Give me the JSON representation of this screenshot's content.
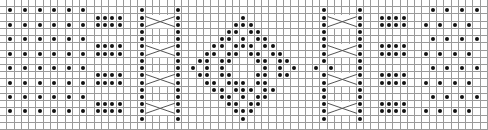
{
  "chart": {
    "columns": 67,
    "rows": 18,
    "legend": {
      "o": "dot (purl stitch)",
      ".": "empty cell (knit stitch)"
    },
    "grid_rows": [
      "...................................................................",
      ".o.o.o.o.o.o.......o....o...................o....o.........o.o.o.o.",
      ".............oooo..o....o........o..........o....o..oooo..........",
      ".o.o.o.o.o.o.oooo..o....o.......ooo.........o....o..oooo..o.o.o.o.",
      "...................o....o......oo.oo........o....o.................",
      ".o.o.o.o.o.o.......o....o.....oo.o.oo.......o....o.........o.o.o.o.",
      ".............oooo..o....o....oo.ooo.oo......o....o..oooo..........",
      ".o.o.o.o.o.o.oooo..o....o...oo.oo.oo.oo.....o....o..oooo..o.o.o.o.",
      "...................o....o..oo.oo...oo.oo....o....o.................",
      ".o.o.o.o.o.o.......o....o.o.o.o.....o.o.o..o.o...o.........o.o.o.o.",
      ".............oooo..o....o..oo.oo...oo.oo....o....o..oooo..........",
      ".o.o.o.o.o.o.oooo..o....o...oo.ooo.oo.......o....o..oooo..o.o.o.o.",
      "...................o....o....oo.ooo.oo......o....o.................",
      ".o.o.o.o.o.o.......o....o.....oo.o.oo.......o....o.........o.o.o.o.",
      ".............oooo..o....o......oo.oo........o....o..oooo..........",
      ".o.o.o.o.o.o.oooo..o....o.......ooo.........o....o..oooo..o.o.o.o.",
      "...................o....o........o..........o....o.................",
      "..................................................................."
    ],
    "cables": [
      {
        "name": "left-cable",
        "col_start": 20,
        "col_end": 23,
        "cross_rows": [
          2,
          6,
          10,
          14
        ]
      },
      {
        "name": "right-cable",
        "col_start": 45,
        "col_end": 48,
        "cross_rows": [
          2,
          6,
          10,
          14
        ]
      }
    ]
  }
}
